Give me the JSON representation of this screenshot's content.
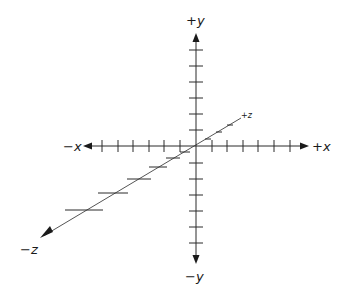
{
  "diagram": {
    "labels": {
      "pos_y": "+y",
      "neg_y": "−y",
      "pos_x": "+x",
      "neg_x": "−x",
      "pos_z": "+z",
      "neg_z": "−z"
    },
    "origin": [
      196,
      146
    ],
    "x_axis": {
      "from": [
        83,
        146
      ],
      "to": [
        309,
        146
      ],
      "tick_positions": [
        102,
        118,
        133,
        149,
        164,
        180,
        212,
        227,
        243,
        258,
        274,
        290
      ]
    },
    "y_axis": {
      "from": [
        196,
        33
      ],
      "to": [
        196,
        264
      ],
      "tick_positions": [
        50,
        66,
        82,
        98,
        114,
        130,
        163,
        179,
        195,
        211,
        227,
        243
      ]
    },
    "z_axis": {
      "from": [
        40,
        238
      ],
      "to": [
        241,
        118
      ],
      "ticks": [
        {
          "x": 208,
          "y": 139,
          "w": 3
        },
        {
          "x": 219,
          "y": 132,
          "w": 3
        },
        {
          "x": 230,
          "y": 125,
          "w": 3
        },
        {
          "x": 185,
          "y": 152,
          "w": 5
        },
        {
          "x": 173,
          "y": 158,
          "w": 7
        },
        {
          "x": 158,
          "y": 167,
          "w": 9
        },
        {
          "x": 139,
          "y": 179,
          "w": 12
        },
        {
          "x": 113,
          "y": 193,
          "w": 15
        },
        {
          "x": 84,
          "y": 210,
          "w": 19
        }
      ]
    },
    "colors": {
      "axis": "#2b2b2b",
      "z_axis": "#555555",
      "background": "#ffffff"
    }
  }
}
